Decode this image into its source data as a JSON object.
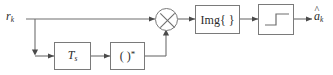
{
  "diagram": {
    "type": "block-diagram",
    "background_color": "#ffffff",
    "line_color": "#6e6e6e",
    "block_border_color": "#7a7a7a",
    "text_color": "#2b2b2b",
    "input": {
      "name": "input-signal",
      "base": "r",
      "subscript": "k",
      "label": "r_k"
    },
    "output": {
      "name": "output-decision",
      "base": "a",
      "subscript": "k",
      "accent": "^",
      "label": "a_k_hat"
    },
    "blocks": [
      {
        "id": "delay",
        "name": "delay-block",
        "base": "T",
        "subscript": "s",
        "label": "T_s",
        "style": "italic"
      },
      {
        "id": "conjugate",
        "name": "conjugate-block",
        "base": "( )",
        "superscript": "*",
        "label": "( )*",
        "style": "upright"
      },
      {
        "id": "imag",
        "name": "imaginary-part-block",
        "label": "Img{ }",
        "style": "upright"
      },
      {
        "id": "slicer",
        "name": "slicer-block",
        "label": "",
        "glyph": "step-function-icon",
        "style": "glyph"
      }
    ],
    "operators": [
      {
        "id": "mixer",
        "name": "multiplier-node",
        "symbol": "cross-circle-icon",
        "operation": "multiply"
      }
    ],
    "junctions": [
      {
        "id": "branch",
        "name": "signal-branch-node",
        "symbol": "branch-dot"
      }
    ]
  }
}
